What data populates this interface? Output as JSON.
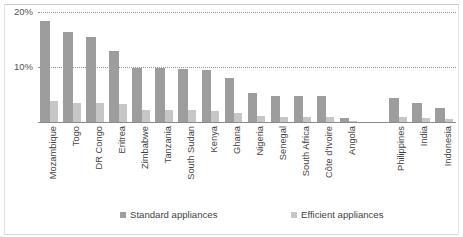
{
  "chart_data": {
    "type": "bar",
    "title": "",
    "subtitle": "",
    "xlabel": "",
    "ylabel": "",
    "ylim": [
      0,
      20
    ],
    "yticks": [
      "10%",
      "20%"
    ],
    "ytick_values": [
      10,
      20
    ],
    "grid": true,
    "legend_position": "bottom",
    "value_unit": "%",
    "categories": [
      "Mozambique",
      "Togo",
      "DR Congo",
      "Eritrea",
      "Zimbabwe",
      "Tanzania",
      "South Sudan",
      "Kenya",
      "Ghana",
      "Nigeria",
      "Senegal",
      "South Africa",
      "Côte d'Ivoire",
      "Angola",
      "Philippines",
      "India",
      "Indonesia"
    ],
    "group_break_after_index": 13,
    "series": [
      {
        "name": "Standard appliances",
        "color": "#9d9d9d",
        "values": [
          18.4,
          16.4,
          15.4,
          12.9,
          9.8,
          9.8,
          9.7,
          9.4,
          8.0,
          5.3,
          4.8,
          4.8,
          4.7,
          0.8,
          4.3,
          3.4,
          2.6
        ]
      },
      {
        "name": "Efficient appliances",
        "color": "#c6c6c6",
        "values": [
          3.9,
          3.5,
          3.4,
          3.2,
          2.2,
          2.1,
          2.1,
          2.0,
          1.7,
          1.1,
          1.0,
          1.0,
          1.0,
          0.2,
          0.9,
          0.7,
          0.5
        ]
      }
    ]
  },
  "legend": {
    "items": [
      {
        "label": "Standard appliances",
        "color": "#9d9d9d"
      },
      {
        "label": "Efficient appliances",
        "color": "#c6c6c6"
      }
    ]
  }
}
